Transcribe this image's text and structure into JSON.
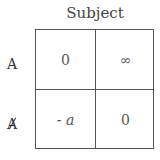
{
  "title": "Subject",
  "rows": [
    {
      "label": "A",
      "negated": false,
      "cells": [
        "0",
        "∞"
      ]
    },
    {
      "label": "A",
      "negated": true,
      "cells": [
        "- a",
        "0"
      ]
    }
  ]
}
